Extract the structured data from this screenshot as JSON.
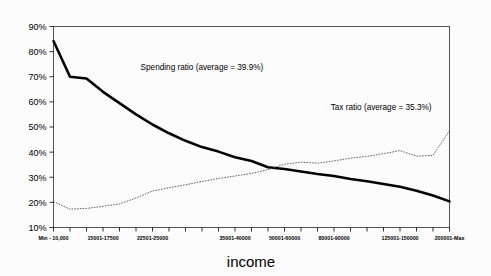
{
  "chart_data": {
    "type": "line",
    "title": "",
    "xlabel": "income",
    "ylabel": "",
    "ylim": [
      10,
      90
    ],
    "ytick_labels": [
      "90%",
      "80%",
      "70%",
      "60%",
      "50%",
      "40%",
      "30%",
      "20%",
      "10%"
    ],
    "ytick_values": [
      90,
      80,
      70,
      60,
      50,
      40,
      30,
      20,
      10
    ],
    "grid": false,
    "legend_position": "inline-annotation",
    "categories": [
      "Min - 10,000",
      "10001-12500",
      "12501-15000",
      "15001-17500",
      "17501-20000",
      "20001-22500",
      "22501-25000",
      "25001-27500",
      "27501-30000",
      "30001-32500",
      "32501-35000",
      "35001-40000",
      "40001-45000",
      "45001-50000",
      "50001-60000",
      "60001-70000",
      "70001-80000",
      "80001-90000",
      "90001-100000",
      "100001-110000",
      "110001-125000",
      "125001-150000",
      "150001-175000",
      "175001-200000",
      "200001-Max"
    ],
    "visible_xtick_labels": [
      "Min - 10,000",
      "15001-17500",
      "22501-25000",
      "35001-40000",
      "50001-60000",
      "80001-90000",
      "125001-150000",
      "200001-Max"
    ],
    "series": [
      {
        "name": "Spending ratio",
        "average_label": "Spending ratio  (average = 39.9%)",
        "average": 39.9,
        "style": "thick-solid",
        "color": "#000000",
        "values": [
          84.2,
          70.0,
          69.3,
          64.0,
          59.5,
          55.0,
          51.0,
          47.5,
          44.5,
          42.0,
          40.2,
          38.0,
          36.5,
          34.0,
          33.3,
          32.3,
          31.3,
          30.5,
          29.3,
          28.4,
          27.3,
          26.2,
          24.6,
          22.7,
          20.4
        ]
      },
      {
        "name": "Tax ratio",
        "average_label": "Tax ratio  (average = 35.3%)",
        "average": 35.3,
        "style": "thin-dotted",
        "color": "#444444",
        "values": [
          20.3,
          17.3,
          17.6,
          18.4,
          19.4,
          21.7,
          24.5,
          25.8,
          27.0,
          28.3,
          29.5,
          30.5,
          31.5,
          33.0,
          35.2,
          36.0,
          35.6,
          36.5,
          37.6,
          38.3,
          39.4,
          40.6,
          38.4,
          38.7,
          48.5
        ]
      }
    ],
    "annotations": [
      {
        "text": "Spending ratio  (average = 39.9%)",
        "x_frac": 0.22,
        "y_frac": 0.215
      },
      {
        "text": "Tax ratio  (average = 35.3%)",
        "x_frac": 0.7,
        "y_frac": 0.415
      }
    ]
  }
}
